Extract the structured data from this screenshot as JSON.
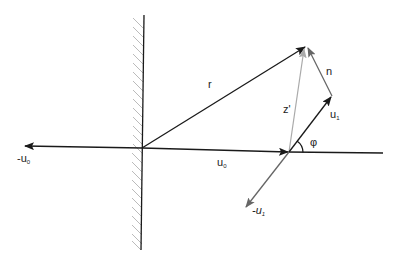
{
  "diagram": {
    "labels": {
      "r": "r",
      "n": "n",
      "z_prime": "z'",
      "u1": "u",
      "u1_sub": "1",
      "u0": "u",
      "u0_sub": "0",
      "neg_u0": "-u",
      "neg_u0_sub": "0",
      "neg_u1": "-u",
      "neg_u1_sub": "1",
      "phi": "φ"
    },
    "colors": {
      "black_line": "#1a1a1a",
      "gray_vector": "#666666",
      "light_gray_vector": "#aaaaaa",
      "hatch": "#bbbbbb"
    }
  }
}
